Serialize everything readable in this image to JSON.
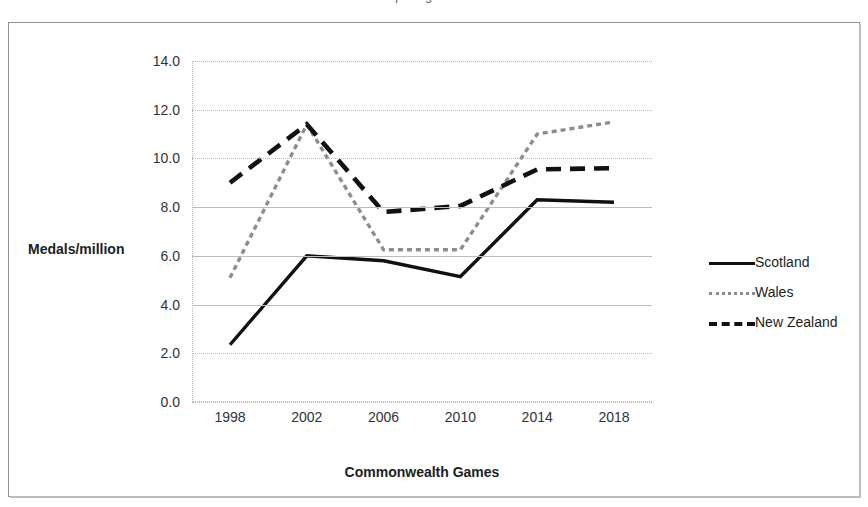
{
  "title_clipped": "Sporting Success",
  "chart_data": {
    "type": "line",
    "title": "Sporting Success",
    "xlabel": "Commonwealth Games",
    "ylabel": "Medals/million",
    "categories": [
      "1998",
      "2002",
      "2006",
      "2010",
      "2014",
      "2018"
    ],
    "ylim": [
      0.0,
      14.0
    ],
    "ytick_step": 2.0,
    "ytick_labels": [
      "0.0",
      "2.0",
      "4.0",
      "6.0",
      "8.0",
      "10.0",
      "12.0",
      "14.0"
    ],
    "grid": true,
    "legend_position": "right",
    "series": [
      {
        "name": "Scotland",
        "style": "solid",
        "color": "#111111",
        "values": [
          2.35,
          6.0,
          5.8,
          5.15,
          8.3,
          8.2
        ]
      },
      {
        "name": "Wales",
        "style": "fine-dotted",
        "color": "#8a8d91",
        "values": [
          5.1,
          11.4,
          6.25,
          6.25,
          11.0,
          11.5
        ]
      },
      {
        "name": "New Zealand",
        "style": "bold-dashed",
        "color": "#111111",
        "values": [
          9.0,
          11.4,
          7.8,
          8.05,
          9.55,
          9.6
        ]
      }
    ]
  },
  "axis": {
    "y_label": "Medals/million",
    "x_label": "Commonwealth Games",
    "y_ticks": [
      "14.0",
      "12.0",
      "10.0",
      "8.0",
      "6.0",
      "4.0",
      "2.0",
      "0.0"
    ],
    "x_ticks": [
      "1998",
      "2002",
      "2006",
      "2010",
      "2014",
      "2018"
    ]
  },
  "legend": {
    "items": [
      {
        "label": "Scotland",
        "swatch": "solid-line-icon"
      },
      {
        "label": "Wales",
        "swatch": "dotted-line-icon"
      },
      {
        "label": "New Zealand",
        "swatch": "dashed-line-icon"
      }
    ]
  }
}
